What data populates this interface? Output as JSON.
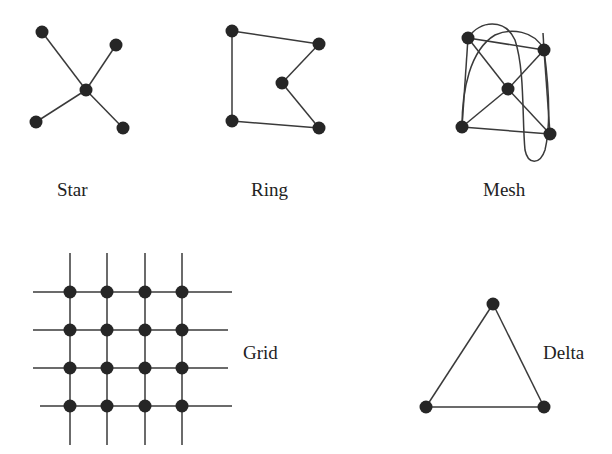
{
  "diagram": {
    "type": "network-topologies",
    "topologies": [
      {
        "name": "Star",
        "label": "Star",
        "label_pos": [
          57,
          196
        ],
        "nodes": [
          [
            42,
            32
          ],
          [
            116,
            45
          ],
          [
            86,
            90
          ],
          [
            36,
            122
          ],
          [
            123,
            128
          ]
        ],
        "edges": [
          [
            0,
            2
          ],
          [
            1,
            2
          ],
          [
            3,
            2
          ],
          [
            4,
            2
          ]
        ]
      },
      {
        "name": "Ring",
        "label": "Ring",
        "label_pos": [
          251,
          196
        ],
        "nodes": [
          [
            232,
            31
          ],
          [
            319,
            44
          ],
          [
            282,
            83
          ],
          [
            232,
            121
          ],
          [
            319,
            128
          ]
        ],
        "edges": [
          [
            0,
            1
          ],
          [
            1,
            2
          ],
          [
            2,
            4
          ],
          [
            4,
            3
          ],
          [
            3,
            0
          ]
        ]
      },
      {
        "name": "Mesh",
        "label": "Mesh",
        "label_pos": [
          483,
          196
        ],
        "nodes": [
          [
            468,
            38
          ],
          [
            544,
            50
          ],
          [
            508,
            89
          ],
          [
            462,
            127
          ],
          [
            550,
            134
          ]
        ],
        "edges": [
          [
            0,
            1
          ],
          [
            0,
            2
          ],
          [
            2,
            4
          ],
          [
            1,
            2
          ],
          [
            2,
            3
          ],
          [
            3,
            4
          ],
          [
            0,
            3
          ],
          [
            1,
            4
          ]
        ]
      },
      {
        "name": "Grid",
        "label": "Grid",
        "label_pos": [
          243,
          359
        ],
        "cols": [
          70,
          107,
          145,
          182
        ],
        "rows": [
          292,
          330,
          368,
          406
        ]
      },
      {
        "name": "Delta",
        "label": "Delta",
        "label_pos": [
          543,
          359
        ],
        "nodes": [
          [
            493,
            304
          ],
          [
            426,
            407
          ],
          [
            544,
            407
          ]
        ],
        "edges": [
          [
            0,
            1
          ],
          [
            1,
            2
          ],
          [
            2,
            0
          ]
        ]
      }
    ],
    "colors": {
      "node": "#262626",
      "edge": "#3a3a3a",
      "background": "#ffffff"
    }
  }
}
